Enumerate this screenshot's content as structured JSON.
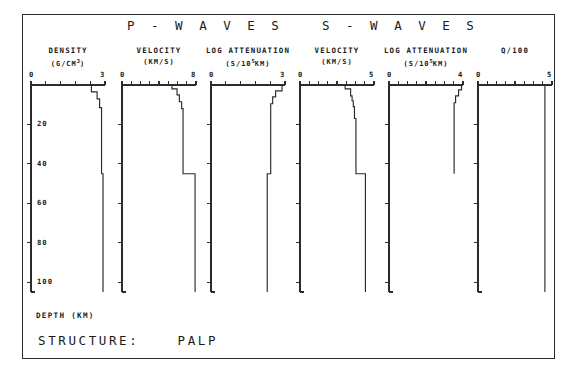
{
  "figure": {
    "frame_border_color": "#2b2b2b",
    "background": "#ffffff",
    "structure_label": "STRUCTURE:",
    "structure_value": "PALP",
    "depth_caption": "DEPTH (KM)",
    "group_titles": [
      {
        "text": "P - W A V E S"
      },
      {
        "text": "S - W A V E S"
      }
    ]
  },
  "depth_axis": {
    "label": "DEPTH (KM)",
    "min": 0,
    "max": 105,
    "ticks": [
      20,
      40,
      60,
      80,
      100
    ],
    "tick_labels": [
      "20",
      "40",
      "60",
      "80",
      "100"
    ]
  },
  "chart_data": {
    "type": "line",
    "title": "STRUCTURE: PALP",
    "subtitle": "P - W A V E S     S - W A V E S",
    "ylabel": "DEPTH (KM)",
    "ylim": [
      0,
      105
    ],
    "yticks": [
      20,
      40,
      60,
      80,
      100
    ],
    "y_inverted": true,
    "grid": false,
    "legend": "none",
    "panels": [
      {
        "id": "density",
        "group": "P-WAVES",
        "title": "DENSITY",
        "unit": "(G/CM3)",
        "unit_html": "(G/CM<sup>3</sup>)",
        "xlabel": "DENSITY (G/CM^3)",
        "xlim": [
          0,
          3
        ],
        "xmin_label": "0",
        "xmax_label": "3",
        "xticks": [
          0,
          0.6,
          1.2,
          1.8,
          2.4,
          3.0
        ],
        "x": [
          2.45,
          2.45,
          2.68,
          2.68,
          2.78,
          2.78,
          2.86,
          2.86,
          2.92,
          2.92
        ],
        "depth": [
          0,
          3.5,
          3.5,
          7.0,
          7.0,
          11.5,
          11.5,
          45.0,
          45.0,
          105.0
        ]
      },
      {
        "id": "p-velocity",
        "group": "P-WAVES",
        "title": "VELOCITY",
        "unit": "(KM/S)",
        "xlabel": "VELOCITY (KM/S)",
        "xlim": [
          0,
          8
        ],
        "xmin_label": "0",
        "xmax_label": "8",
        "xticks": [
          0,
          1,
          2,
          3,
          4,
          5,
          6,
          7,
          8
        ],
        "x": [
          5.4,
          5.4,
          5.95,
          5.95,
          6.2,
          6.2,
          6.45,
          6.45,
          6.6,
          6.6,
          7.9,
          7.9
        ],
        "depth": [
          0,
          2.0,
          2.0,
          5.0,
          5.0,
          8.5,
          8.5,
          12.0,
          12.0,
          45.0,
          45.0,
          105.0
        ]
      },
      {
        "id": "p-log-attenuation",
        "group": "P-WAVES",
        "title": "LOG ATTENUATION",
        "unit": "(S/105KM)",
        "unit_html": "(S/10<sup>5</sup>KM)",
        "xlabel": "LOG ATTENUATION (S/10^5 KM)",
        "xlim": [
          0,
          3
        ],
        "xmin_label": "0",
        "xmax_label": "3",
        "xticks": [
          0,
          0.6,
          1.2,
          1.8,
          2.4,
          3.0
        ],
        "x": [
          2.88,
          2.88,
          2.62,
          2.62,
          2.5,
          2.5,
          2.42,
          2.42,
          2.28,
          2.28
        ],
        "depth": [
          0,
          3.0,
          3.0,
          6.0,
          6.0,
          9.5,
          9.5,
          45.0,
          45.0,
          105.0
        ]
      },
      {
        "id": "s-velocity",
        "group": "S-WAVES",
        "title": "VELOCITY",
        "unit": "(KM/S)",
        "xlabel": "VELOCITY (KM/S)",
        "xlim": [
          0,
          5
        ],
        "xmin_label": "0",
        "xmax_label": "5",
        "xticks": [
          0,
          0.625,
          1.25,
          1.875,
          2.5,
          3.125,
          3.75,
          4.375,
          5.0
        ],
        "x": [
          3.05,
          3.05,
          3.42,
          3.42,
          3.52,
          3.52,
          3.6,
          3.6,
          3.68,
          3.68,
          3.78,
          3.78,
          4.42,
          4.42
        ],
        "depth": [
          0,
          2.0,
          2.0,
          5.5,
          5.5,
          8.0,
          8.0,
          11.0,
          11.0,
          17.0,
          17.0,
          45.0,
          45.0,
          105.0
        ]
      },
      {
        "id": "s-log-attenuation",
        "group": "S-WAVES",
        "title": "LOG ATTENUATION",
        "unit": "(S/105KM)",
        "unit_html": "(S/10<sup>5</sup>KM)",
        "xlabel": "LOG ATTENUATION (S/10^5 KM)",
        "xlim": [
          0,
          4
        ],
        "xmin_label": "0",
        "xmax_label": "4",
        "xticks": [
          0,
          0.5,
          1.0,
          1.5,
          2.0,
          2.5,
          3.0,
          3.5,
          4.0
        ],
        "x": [
          3.92,
          3.92,
          3.76,
          3.76,
          3.6,
          3.6,
          3.52,
          3.52
        ],
        "depth": [
          0,
          2.5,
          2.5,
          5.5,
          5.5,
          9.0,
          9.0,
          45.0,
          45.0,
          105.0
        ]
      },
      {
        "id": "q-over-100",
        "group": "",
        "title": "Q/100",
        "unit": "",
        "xlabel": "Q/100",
        "xlim": [
          0,
          5
        ],
        "xmin_label": "0",
        "xmax_label": "5",
        "xticks": [
          0,
          0.625,
          1.25,
          1.875,
          2.5,
          3.125,
          3.75,
          4.375,
          5.0
        ],
        "x": [
          4.52,
          4.52
        ],
        "depth": [
          0,
          105.0
        ]
      }
    ]
  }
}
